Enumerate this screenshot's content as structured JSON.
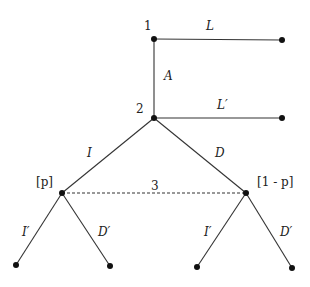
{
  "diagram": {
    "type": "extensive-form game tree",
    "nodes": {
      "n1": {
        "label": "1",
        "x": 154,
        "y": 39
      },
      "n2": {
        "label": "2",
        "x": 154,
        "y": 118
      },
      "n3a": {
        "label": "[p]",
        "x": 62,
        "y": 193
      },
      "n3b": {
        "label": "[1 - p]",
        "x": 246,
        "y": 193
      }
    },
    "edges": {
      "L": "L",
      "A": "A",
      "Lp": "L′",
      "I": "I",
      "D": "D",
      "Ip_left": "I′",
      "Dp_left": "D′",
      "Ip_right": "I′",
      "Dp_right": "D′"
    },
    "info_set_label": "3",
    "node_labels": {
      "player1": "1",
      "player2": "2",
      "belief_left": "[p]",
      "belief_right": "[1 - p]"
    }
  }
}
